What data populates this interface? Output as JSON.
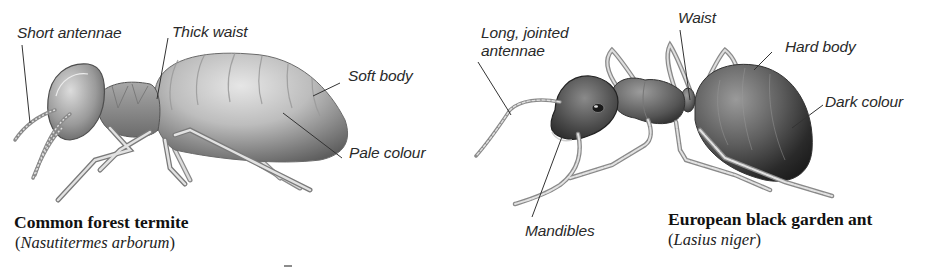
{
  "diagram": {
    "colors": {
      "background": "#ffffff",
      "label_text": "#2a2a2a",
      "caption_text": "#111111",
      "leader_line": "#333333",
      "termite_body_light": "#d9d9d9",
      "termite_body_dark": "#6b6b6b",
      "ant_body_dark": "#2f2f2f"
    },
    "termite": {
      "common_name": "Common forest termite",
      "scientific_name": "Nasutitermes arborum",
      "paren_open": "(",
      "paren_close": ")",
      "labels": {
        "antennae": "Short antennae",
        "waist": "Thick waist",
        "body": "Soft body",
        "colour": "Pale colour"
      }
    },
    "ant": {
      "common_name": "European black garden ant",
      "scientific_name": "Lasius niger",
      "paren_open": "(",
      "paren_close": ")",
      "labels": {
        "antennae_line1": "Long, jointed",
        "antennae_line2": "antennae",
        "waist": "Waist",
        "body": "Hard body",
        "colour": "Dark colour",
        "mandibles": "Mandibles"
      }
    }
  }
}
